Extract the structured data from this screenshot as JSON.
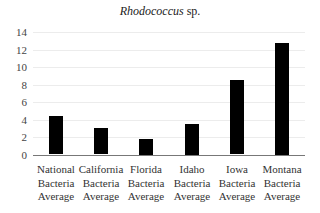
{
  "chart_data": {
    "type": "bar",
    "title": "Rhodococcus sp.",
    "title_parts": {
      "italic": "Rhodococcus",
      "normal": " sp."
    },
    "categories": [
      "National Bacteria Average",
      "California Bacteria Average",
      "Florida Bacteria Average",
      "Idaho Bacteria Average",
      "Iowa Bacteria Average",
      "Montana Bacteria Average"
    ],
    "category_lines": [
      [
        "National",
        "Bacteria",
        "Average"
      ],
      [
        "California",
        "Bacteria",
        "Average"
      ],
      [
        "Florida",
        "Bacteria",
        "Average"
      ],
      [
        "Idaho",
        "Bacteria",
        "Average"
      ],
      [
        "Iowa",
        "Bacteria",
        "Average"
      ],
      [
        "Montana",
        "Bacteria",
        "Average"
      ]
    ],
    "values": [
      4.4,
      3.0,
      1.8,
      3.5,
      8.5,
      12.8
    ],
    "xlabel": "",
    "ylabel": "",
    "ylim": [
      0,
      14
    ],
    "yticks": [
      0,
      2,
      4,
      6,
      8,
      10,
      12,
      14
    ],
    "grid": true,
    "legend": null,
    "bar_color": "#000000",
    "grid_color": "#ececec"
  }
}
